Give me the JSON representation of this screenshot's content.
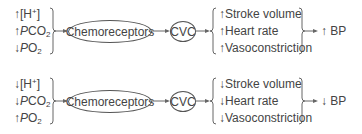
{
  "diagrams": [
    {
      "inputs": [
        {
          "arrow": "↑",
          "label": "[H+]"
        },
        {
          "arrow": "↑",
          "label": "PCO2"
        },
        {
          "arrow": "↓",
          "label": "PO2"
        }
      ],
      "receptor": "Chemoreceptors",
      "center": "CVC",
      "effects": [
        {
          "arrow": "↑",
          "label": "Stroke volume"
        },
        {
          "arrow": "↑",
          "label": "Heart rate"
        },
        {
          "arrow": "↑",
          "label": "Vasoconstriction"
        }
      ],
      "result": {
        "arrow": "↑",
        "label": "BP"
      }
    },
    {
      "inputs": [
        {
          "arrow": "↓",
          "label": "[H+]"
        },
        {
          "arrow": "↓",
          "label": "PCO2"
        },
        {
          "arrow": "↑",
          "label": "PO2"
        }
      ],
      "receptor": "Chemoreceptors",
      "center": "CVC",
      "effects": [
        {
          "arrow": "↓",
          "label": "Stroke volume"
        },
        {
          "arrow": "↓",
          "label": "Heart rate"
        },
        {
          "arrow": "↓",
          "label": "Vasoconstriction"
        }
      ],
      "result": {
        "arrow": "↓",
        "label": "BP"
      }
    }
  ]
}
